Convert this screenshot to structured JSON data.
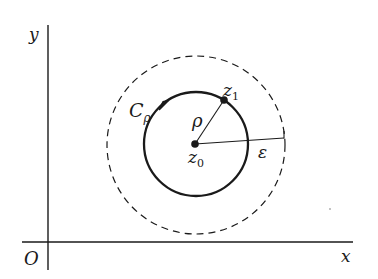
{
  "figure": {
    "colors": {
      "stroke": "#1a1a1a",
      "background": "#ffffff"
    },
    "axes": {
      "origin_label": "O",
      "x_label": "x",
      "y_label": "y"
    },
    "points": {
      "center": {
        "label": "z",
        "subscript": "0"
      },
      "on_circle": {
        "label": "z",
        "subscript": "1"
      }
    },
    "curves": {
      "contour": {
        "label": "C",
        "subscript": "ρ",
        "style": "solid",
        "orientation": "counterclockwise"
      },
      "neighborhood": {
        "style": "dashed"
      }
    },
    "radii": {
      "inner": {
        "label": "ρ"
      },
      "outer": {
        "label": "ε"
      }
    }
  }
}
